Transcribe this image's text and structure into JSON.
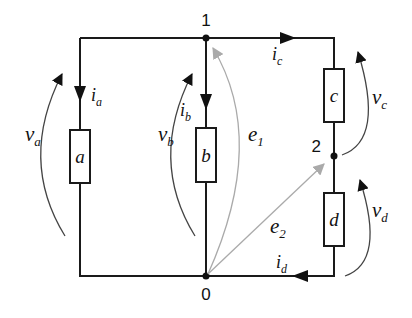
{
  "diagram": {
    "type": "electric-circuit",
    "nodes": [
      {
        "id": "1",
        "label": "1"
      },
      {
        "id": "0",
        "label": "0"
      },
      {
        "id": "2",
        "label": "2"
      }
    ],
    "elements": [
      {
        "id": "a",
        "label": "a",
        "current": "i",
        "current_sub": "a",
        "voltage": "v",
        "voltage_sub": "a"
      },
      {
        "id": "b",
        "label": "b",
        "current": "i",
        "current_sub": "b",
        "voltage": "v",
        "voltage_sub": "b"
      },
      {
        "id": "c",
        "label": "c",
        "current": "i",
        "current_sub": "c",
        "voltage": "v",
        "voltage_sub": "c"
      },
      {
        "id": "d",
        "label": "d",
        "current": "i",
        "current_sub": "d",
        "voltage": "v",
        "voltage_sub": "d"
      }
    ],
    "node_potentials": [
      {
        "id": "e1",
        "label": "e",
        "sub": "1",
        "from": "0",
        "to": "1"
      },
      {
        "id": "e2",
        "label": "e",
        "sub": "2",
        "from": "0",
        "to": "2"
      }
    ],
    "colors": {
      "wire": "#1a1a1a",
      "voltage_arrow": "#444444",
      "potential_arrow": "#aaaaaa"
    }
  }
}
